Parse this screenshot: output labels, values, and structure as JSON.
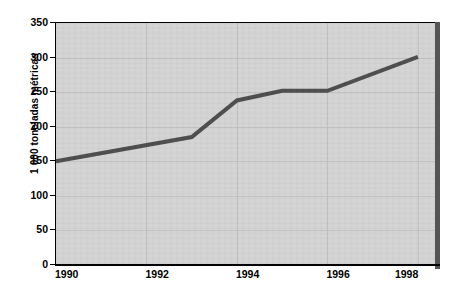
{
  "chart_data": {
    "type": "line",
    "title": "",
    "xlabel": "",
    "ylabel": "1 000 toneladas métricas",
    "x": [
      1990,
      1993,
      1994,
      1995,
      1996,
      1998
    ],
    "values": [
      150,
      185,
      238,
      252,
      252,
      301
    ],
    "series": [
      {
        "name": "",
        "x": [
          1990,
          1993,
          1994,
          1995,
          1996,
          1998
        ],
        "values": [
          150,
          185,
          238,
          252,
          252,
          301
        ]
      }
    ],
    "xlim": [
      1990,
      1998.4
    ],
    "ylim": [
      0,
      350
    ],
    "ytick_labels": [
      "350",
      "300",
      "250",
      "200",
      "150",
      "100",
      "50",
      "0"
    ],
    "ytick_values": [
      350,
      300,
      250,
      200,
      150,
      100,
      50,
      0
    ],
    "xtick_labels": [
      "1990",
      "1992",
      "1994",
      "1996",
      "1998"
    ],
    "xtick_values": [
      1990,
      1992,
      1994,
      1996,
      1998
    ],
    "grid": true,
    "legend": "none",
    "colors": {
      "plot_background": "#d4d4d4",
      "line": "#4d4d4d",
      "axis": "#000000",
      "gridline": "#c2c2c2",
      "page_background": "#ffffff"
    }
  }
}
